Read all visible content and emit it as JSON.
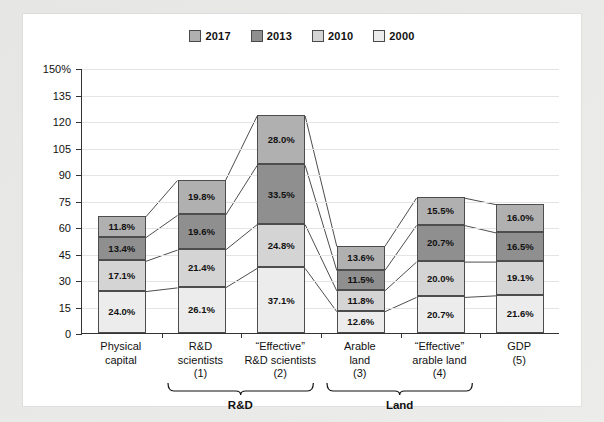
{
  "chart_data": {
    "type": "bar",
    "stacked": true,
    "title": "",
    "subtitle": "",
    "xlabel": "",
    "ylabel": "",
    "ylim": [
      0,
      150
    ],
    "ytick_values": [
      0,
      15,
      30,
      45,
      60,
      75,
      90,
      105,
      120,
      135,
      150
    ],
    "ytick_labels": [
      "0",
      "15",
      "30",
      "45",
      "60",
      "75",
      "90",
      "105",
      "120",
      "135",
      "150%"
    ],
    "grid": true,
    "legend_position": "top-center",
    "legend": [
      "2017",
      "2013",
      "2010",
      "2000"
    ],
    "categories": [
      "Physical capital",
      "R&D scientists (1)",
      "“Effective” R&D scientists (2)",
      "Arable land (3)",
      "“Effective” arable land (4)",
      "GDP (5)"
    ],
    "series": [
      {
        "name": "2000",
        "values": [
          24.0,
          26.1,
          37.1,
          12.6,
          20.7,
          21.6
        ]
      },
      {
        "name": "2010",
        "values": [
          17.1,
          21.4,
          24.8,
          11.8,
          20.0,
          19.1
        ]
      },
      {
        "name": "2013",
        "values": [
          13.4,
          19.6,
          33.5,
          11.5,
          20.7,
          16.5
        ]
      },
      {
        "name": "2017",
        "values": [
          11.8,
          19.8,
          28.0,
          13.6,
          15.5,
          16.0
        ]
      }
    ],
    "data_labels": [
      [
        "24.0%",
        "17.1%",
        "13.4%",
        "11.8%"
      ],
      [
        "26.1%",
        "21.4%",
        "19.6%",
        "19.8%"
      ],
      [
        "37.1%",
        "24.8%",
        "33.5%",
        "28.0%"
      ],
      [
        "12.6%",
        "11.8%",
        "11.5%",
        "13.6%"
      ],
      [
        "20.7%",
        "20.0%",
        "20.7%",
        "15.5%"
      ],
      [
        "21.6%",
        "19.1%",
        "16.5%",
        "16.0%"
      ]
    ],
    "series_colors": {
      "2017": "#b0b0b0",
      "2013": "#8f8f8f",
      "2010": "#d4d4d4",
      "2000": "#ececec"
    },
    "annotations": [
      "connector lines join adjacent stacked bar segment boundaries"
    ]
  },
  "legend": {
    "items": [
      {
        "label": "2017",
        "color": "#b0b0b0"
      },
      {
        "label": "2013",
        "color": "#8f8f8f"
      },
      {
        "label": "2010",
        "color": "#d4d4d4"
      },
      {
        "label": "2000",
        "color": "#ececec"
      }
    ]
  },
  "axis": {
    "y_labels": [
      "150%",
      "135",
      "120",
      "105",
      "90",
      "75",
      "60",
      "45",
      "30",
      "15",
      "0"
    ]
  },
  "x_categories": [
    {
      "line1": "Physical",
      "line2": "capital",
      "line3": ""
    },
    {
      "line1": "R&D",
      "line2": "scientists",
      "line3": "(1)"
    },
    {
      "line1": "“Effective”",
      "line2": "R&D scientists",
      "line3": "(2)"
    },
    {
      "line1": "Arable",
      "line2": "land",
      "line3": "(3)"
    },
    {
      "line1": "“Effective”",
      "line2": "arable land",
      "line3": "(4)"
    },
    {
      "line1": "GDP",
      "line2": "(5)",
      "line3": ""
    }
  ],
  "groups": [
    {
      "label": "R&D"
    },
    {
      "label": "Land"
    }
  ]
}
